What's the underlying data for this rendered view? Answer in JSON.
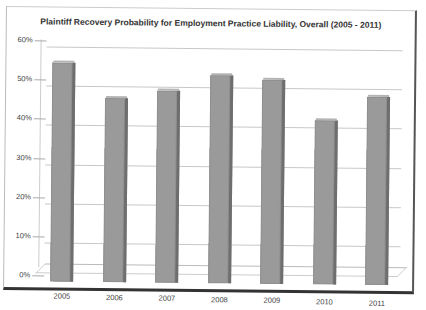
{
  "chart_data": {
    "type": "bar",
    "title": "Plaintiff Recovery Probability for Employment Practice Liability, Overall (2005 - 2011)",
    "xlabel": "",
    "ylabel": "",
    "categories": [
      "2005",
      "2006",
      "2007",
      "2008",
      "2009",
      "2010",
      "2011"
    ],
    "values": [
      56,
      47,
      49,
      53,
      52,
      42,
      48
    ],
    "value_unit": "%",
    "ylim": [
      0,
      60
    ],
    "yticks": [
      "0%",
      "10%",
      "20%",
      "30%",
      "40%",
      "50%",
      "60%"
    ],
    "grid": true,
    "legend": null,
    "style": "3D clustered column, gray bars"
  },
  "colors": {
    "bar": "#9a9a9a",
    "bar_side": "#6e6e6e",
    "gridline": "#c8c8c8"
  }
}
